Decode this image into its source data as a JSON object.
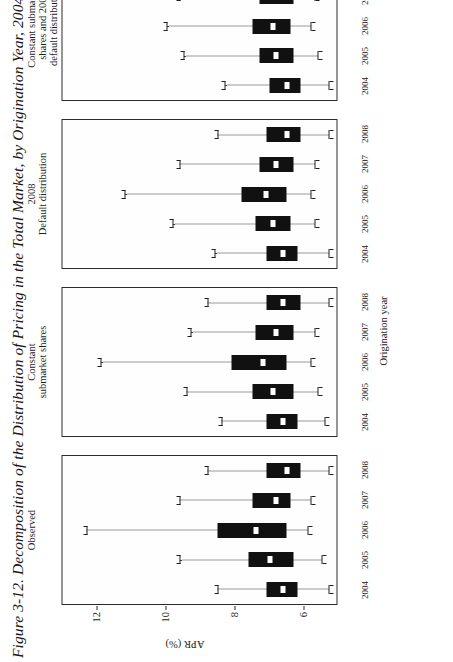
{
  "figure": {
    "title": "Figure 3-12. Decomposition of the Distribution of Pricing in the Total Market, by Origination Year, 2004–08"
  },
  "axes": {
    "y_title": "APR (%)",
    "x_title": "Origination year",
    "y_ticks": [
      "6",
      "8",
      "10",
      "12"
    ],
    "x_ticks": [
      "2004",
      "2005",
      "2006",
      "2007",
      "2008"
    ]
  },
  "chart_data": {
    "type": "box",
    "title": "Figure 3-12. Decomposition of the Distribution of Pricing in the Total Market, by Origination Year, 2004–08",
    "xlabel": "Origination year",
    "ylabel": "APR (%)",
    "ylim": [
      5.0,
      13.0
    ],
    "yticks": [
      6,
      8,
      10,
      12
    ],
    "grid": false,
    "legend": "none",
    "categories": [
      "2004",
      "2005",
      "2006",
      "2007",
      "2008"
    ],
    "panels": [
      {
        "label": "Observed",
        "boxes": [
          {
            "category": "2004",
            "low": 5.3,
            "q1": 6.2,
            "median": 6.6,
            "q3": 7.1,
            "high": 8.5
          },
          {
            "category": "2005",
            "low": 5.5,
            "q1": 6.3,
            "median": 7.0,
            "q3": 7.6,
            "high": 9.6
          },
          {
            "category": "2006",
            "low": 5.9,
            "q1": 6.5,
            "median": 7.4,
            "q3": 8.5,
            "high": 12.3
          },
          {
            "category": "2007",
            "low": 5.8,
            "q1": 6.4,
            "median": 6.8,
            "q3": 7.5,
            "high": 9.6
          },
          {
            "category": "2008",
            "low": 5.3,
            "q1": 6.1,
            "median": 6.5,
            "q3": 7.1,
            "high": 8.8
          }
        ]
      },
      {
        "label": "Constant\nsubmarket shares",
        "boxes": [
          {
            "category": "2004",
            "low": 5.4,
            "q1": 6.2,
            "median": 6.6,
            "q3": 7.1,
            "high": 8.4
          },
          {
            "category": "2005",
            "low": 5.6,
            "q1": 6.3,
            "median": 6.9,
            "q3": 7.5,
            "high": 9.4
          },
          {
            "category": "2006",
            "low": 5.8,
            "q1": 6.5,
            "median": 7.2,
            "q3": 8.1,
            "high": 11.9
          },
          {
            "category": "2007",
            "low": 5.7,
            "q1": 6.3,
            "median": 6.8,
            "q3": 7.4,
            "high": 9.3
          },
          {
            "category": "2008",
            "low": 5.3,
            "q1": 6.1,
            "median": 6.6,
            "q3": 7.1,
            "high": 8.8
          }
        ]
      },
      {
        "label": "2008\nDefault distribution",
        "boxes": [
          {
            "category": "2004",
            "low": 5.3,
            "q1": 6.2,
            "median": 6.6,
            "q3": 7.1,
            "high": 8.6
          },
          {
            "category": "2005",
            "low": 5.7,
            "q1": 6.4,
            "median": 6.9,
            "q3": 7.4,
            "high": 9.8
          },
          {
            "category": "2006",
            "low": 5.8,
            "q1": 6.5,
            "median": 7.1,
            "q3": 7.8,
            "high": 11.2
          },
          {
            "category": "2007",
            "low": 5.7,
            "q1": 6.3,
            "median": 6.8,
            "q3": 7.3,
            "high": 9.6
          },
          {
            "category": "2008",
            "low": 5.3,
            "q1": 6.1,
            "median": 6.5,
            "q3": 7.1,
            "high": 8.5
          }
        ]
      },
      {
        "label": "Constant submarket\nshares and 2008\ndefault distribution",
        "boxes": [
          {
            "category": "2004",
            "low": 5.3,
            "q1": 6.1,
            "median": 6.5,
            "q3": 7.0,
            "high": 8.3
          },
          {
            "category": "2005",
            "low": 5.6,
            "q1": 6.3,
            "median": 6.8,
            "q3": 7.3,
            "high": 9.5
          },
          {
            "category": "2006",
            "low": 5.8,
            "q1": 6.4,
            "median": 6.9,
            "q3": 7.5,
            "high": 10.0
          },
          {
            "category": "2007",
            "low": 5.7,
            "q1": 6.3,
            "median": 6.8,
            "q3": 7.3,
            "high": 9.6
          },
          {
            "category": "2008",
            "low": 5.3,
            "q1": 6.1,
            "median": 6.6,
            "q3": 7.1,
            "high": 8.7
          }
        ]
      }
    ]
  }
}
